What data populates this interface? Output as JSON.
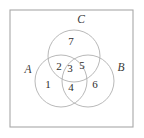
{
  "figure": {
    "title": "",
    "background_color": "#ffffff",
    "frame": {
      "name": "outer-border",
      "stroke_color": "#a8a8a8",
      "x": 10,
      "y": 10,
      "width": 123,
      "height": 117
    }
  },
  "chart_data": {
    "type": "diagram",
    "diagram_type": "venn",
    "title": "",
    "xlabel": "",
    "ylabel": "",
    "grid": false,
    "legend": "none",
    "set_count": 3,
    "stroke_color": "#b0b0b0",
    "label_color": "#3a3a3a",
    "number_color": "#2e2e2e",
    "sets": [
      {
        "label": "A",
        "cx": 61,
        "cy": 81,
        "r": 26,
        "label_x": 28,
        "label_y": 70
      },
      {
        "label": "B",
        "cx": 88,
        "cy": 81,
        "r": 26,
        "label_x": 121,
        "label_y": 68
      },
      {
        "label": "C",
        "cx": 74,
        "cy": 56,
        "r": 26,
        "label_x": 81,
        "label_y": 20
      }
    ],
    "regions": [
      {
        "id": 1,
        "label": "1",
        "membership": "A only",
        "x": 48,
        "y": 85
      },
      {
        "id": 2,
        "label": "2",
        "membership": "A and C only",
        "x": 59,
        "y": 67
      },
      {
        "id": 3,
        "label": "3",
        "membership": "A and B and C",
        "x": 70,
        "y": 69
      },
      {
        "id": 4,
        "label": "4",
        "membership": "A and B only",
        "x": 71,
        "y": 88
      },
      {
        "id": 5,
        "label": "5",
        "membership": "B and C only",
        "x": 82,
        "y": 66
      },
      {
        "id": 6,
        "label": "6",
        "membership": "B only",
        "x": 95,
        "y": 85
      },
      {
        "id": 7,
        "label": "7",
        "membership": "C only",
        "x": 71,
        "y": 42
      }
    ],
    "categories": [
      "1",
      "2",
      "3",
      "4",
      "5",
      "6",
      "7"
    ],
    "values": [
      1,
      2,
      3,
      4,
      5,
      6,
      7
    ]
  }
}
